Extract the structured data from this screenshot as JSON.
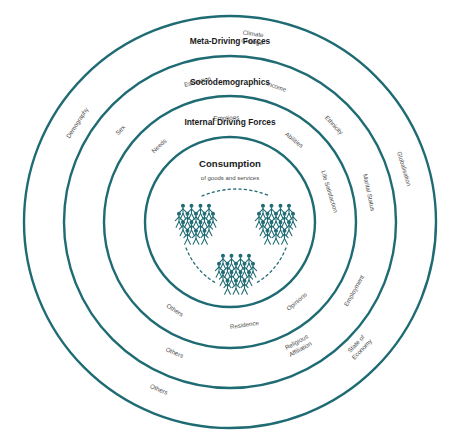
{
  "diagram": {
    "type": "concentric-circles",
    "accent_color": "#1F6B73",
    "label_color": "#4a4a4a",
    "title_color": "#1a1a1a",
    "background": "#ffffff",
    "center": {
      "x": 230,
      "y": 222
    },
    "rings": [
      {
        "id": "meta-driving-forces",
        "title": "Meta-Driving Forces",
        "radius": 206,
        "title_y": 44,
        "labels": [
          {
            "text": "Demography",
            "angle": -57,
            "r": 182
          },
          {
            "text": "Climate Change",
            "angle": 7,
            "r": 184,
            "lines": [
              "Climate",
              "Change"
            ]
          },
          {
            "text": "Globalisation",
            "angle": 73,
            "r": 182
          },
          {
            "text": "State of Economy",
            "angle": 134,
            "r": 181,
            "lines": [
              "State of",
              "Economy"
            ]
          },
          {
            "text": "Others",
            "angle": -157,
            "r": 182
          }
        ]
      },
      {
        "id": "sociodemographics",
        "title": "Sociodemographics",
        "radius": 166,
        "title_y": 85,
        "labels": [
          {
            "text": "Sex",
            "angle": -50,
            "r": 143
          },
          {
            "text": "Education",
            "angle": -13,
            "r": 144
          },
          {
            "text": "Income",
            "angle": 19,
            "r": 143
          },
          {
            "text": "Ethnicity",
            "angle": 47,
            "r": 142
          },
          {
            "text": "Marital Status",
            "angle": 78,
            "r": 142
          },
          {
            "text": "Employment",
            "angle": 119,
            "r": 142
          },
          {
            "text": "Religious Affiliation",
            "angle": 151,
            "r": 143,
            "lines": [
              "Religious",
              "Affiliation"
            ]
          },
          {
            "text": "Others",
            "angle": -157,
            "r": 142
          }
        ]
      },
      {
        "id": "internal-driving-forces",
        "title": "Internal Driving Forces",
        "radius": 126,
        "title_y": 125,
        "labels": [
          {
            "text": "Needs",
            "angle": -43,
            "r": 104
          },
          {
            "text": "Emotions",
            "angle": -2,
            "r": 104
          },
          {
            "text": "Abilities",
            "angle": 38,
            "r": 104
          },
          {
            "text": "Life Satisfaction",
            "angle": 73,
            "r": 104
          },
          {
            "text": "Opinions",
            "angle": 140,
            "r": 104
          },
          {
            "text": "Residence",
            "angle": 172,
            "r": 104
          },
          {
            "text": "Others",
            "angle": -148,
            "r": 104
          }
        ]
      },
      {
        "id": "consumption",
        "title": "Consumption",
        "subtitle": "of goods and services",
        "radius": 85,
        "title_y": 167,
        "subtitle_y": 180,
        "labels": []
      }
    ],
    "people_clusters": [
      {
        "id": "cluster-left",
        "cx": 196,
        "cy": 222
      },
      {
        "id": "cluster-right",
        "cx": 276,
        "cy": 222
      },
      {
        "id": "cluster-bottom",
        "cx": 236,
        "cy": 272
      }
    ],
    "connector_arcs": [
      {
        "id": "arc-top",
        "d": "M 202 196 Q 236 182 270 196"
      },
      {
        "id": "arc-bottom-left",
        "d": "M 186 248 Q 196 272 216 283"
      },
      {
        "id": "arc-bottom-right",
        "d": "M 286 248 Q 276 272 256 283"
      }
    ]
  }
}
